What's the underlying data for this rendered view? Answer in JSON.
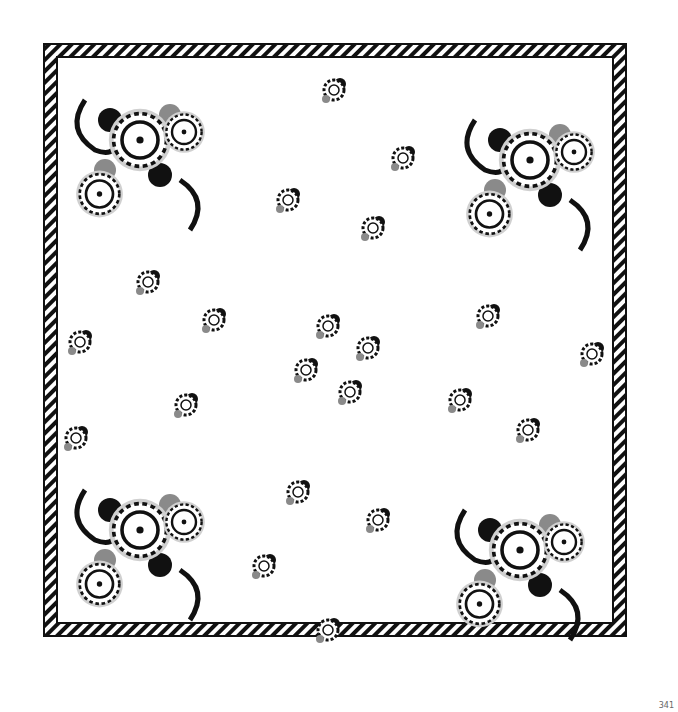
{
  "image": {
    "subject": "Printed square handkerchief with black, grey and white floral paisley pattern",
    "page_number": "341",
    "colors": {
      "paper": "#ffffff",
      "ink": "#111111",
      "grey": "#8a8a8a",
      "light_grey": "#d0d0d0"
    }
  }
}
